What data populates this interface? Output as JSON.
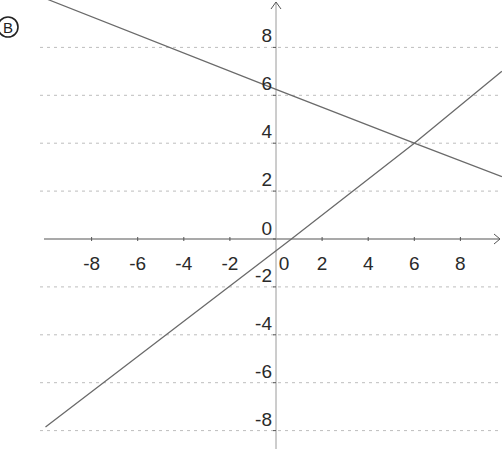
{
  "panel_label": "B",
  "chart_data": {
    "type": "line",
    "title": "",
    "xlabel": "",
    "ylabel": "",
    "xlim": [
      -10,
      10
    ],
    "ylim": [
      -8.5,
      10
    ],
    "grid": {
      "horizontal": true,
      "vertical": false,
      "style": "dotted"
    },
    "x_ticks": [
      -8,
      -6,
      -4,
      -2,
      0,
      2,
      4,
      6,
      8
    ],
    "y_ticks": [
      -8,
      -6,
      -4,
      -2,
      0,
      2,
      4,
      6,
      8
    ],
    "x_tick_labels": [
      "-8",
      "-6",
      "-4",
      "-2",
      "0",
      "2",
      "4",
      "6",
      "8"
    ],
    "y_tick_labels": [
      "-8",
      "-6",
      "-4",
      "-2",
      "0",
      "2",
      "4",
      "6",
      "8"
    ],
    "series": [
      {
        "name": "decreasing line",
        "equation": "y ≈ -0.375x + 6.25",
        "points": [
          [
            -9.9,
            10.0
          ],
          [
            0,
            6.25
          ],
          [
            6,
            4
          ],
          [
            9.8,
            2.6
          ]
        ]
      },
      {
        "name": "increasing line",
        "equation": "y ≈ 0.75x - 0.5",
        "points": [
          [
            -10,
            -7.85
          ],
          [
            0.67,
            0
          ],
          [
            6,
            4
          ],
          [
            9.8,
            7.0
          ]
        ]
      }
    ],
    "annotations": [
      {
        "text": "intersection",
        "x": 6,
        "y": 4
      }
    ]
  },
  "colors": {
    "axis": "#555555",
    "grid": "#bdbdbd",
    "line": "#6a6a6a",
    "text": "#2a2a2a"
  }
}
